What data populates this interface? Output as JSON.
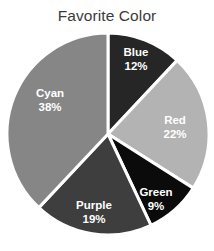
{
  "chart_data": {
    "type": "pie",
    "title": "Favorite Color",
    "xlabel": "",
    "ylabel": "",
    "legend_position": "none",
    "grid": false,
    "labels_inside": true,
    "start_angle_deg": 0,
    "direction": "clockwise",
    "categories": [
      "Blue",
      "Red",
      "Green",
      "Purple",
      "Cyan"
    ],
    "values": [
      12,
      22,
      9,
      19,
      38
    ],
    "value_unit": "%",
    "slices": [
      {
        "name": "Blue",
        "value": 12,
        "label": "Blue",
        "percent_label": "12%",
        "fill": "#262626",
        "label_x": 136,
        "label_y": 56,
        "pct_x": 136,
        "pct_y": 70
      },
      {
        "name": "Red",
        "value": 22,
        "label": "Red",
        "percent_label": "22%",
        "fill": "#b3b3b3",
        "label_x": 175,
        "label_y": 124,
        "pct_x": 175,
        "pct_y": 138
      },
      {
        "name": "Green",
        "value": 9,
        "label": "Green",
        "percent_label": "9%",
        "fill": "#0b0b0b",
        "label_x": 156,
        "label_y": 196,
        "pct_x": 156,
        "pct_y": 210
      },
      {
        "name": "Purple",
        "value": 19,
        "label": "Purple",
        "percent_label": "19%",
        "fill": "#3e3e3e",
        "label_x": 94,
        "label_y": 209,
        "pct_x": 94,
        "pct_y": 223
      },
      {
        "name": "Cyan",
        "value": 38,
        "label": "Cyan",
        "percent_label": "38%",
        "fill": "#868686",
        "label_x": 50,
        "label_y": 97,
        "pct_x": 50,
        "pct_y": 111
      }
    ],
    "geometry": {
      "center_x": 108,
      "center_y": 134,
      "radius": 101
    },
    "style": {
      "background": "#ffffff",
      "separator_color": "#ffffff",
      "separator_width": 3,
      "title_color": "#3b3b3b",
      "label_color": "#ffffff"
    }
  }
}
